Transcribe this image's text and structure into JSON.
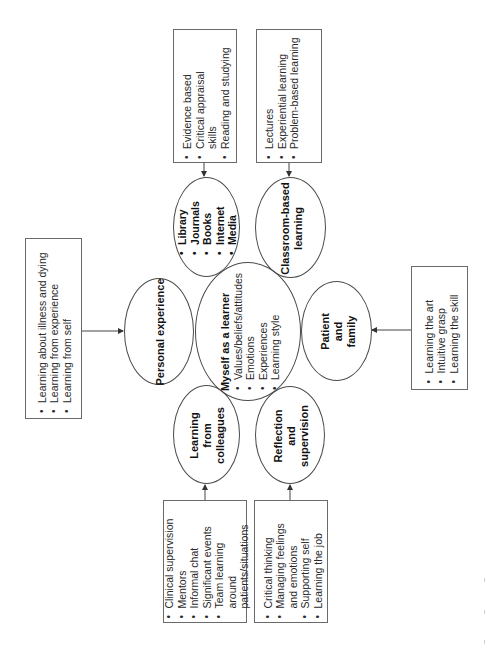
{
  "center": {
    "title": "Myself as a learner",
    "items": [
      "Values/beliefs/attitudes",
      "Emotions",
      "Experiences",
      "Learning style"
    ]
  },
  "nodes": {
    "personal": {
      "title": "Personal experience"
    },
    "library": {
      "items": [
        "Library",
        "Journals",
        "Books",
        "Internet",
        "Media"
      ]
    },
    "classroom": {
      "line1": "Classroom-based",
      "line2": "learning"
    },
    "patient": {
      "line1": "Patient",
      "line2": "and",
      "line3": "family"
    },
    "colleagues": {
      "line1": "Learning",
      "line2": "from",
      "line3": "colleagues"
    },
    "reflection": {
      "line1": "Reflection",
      "line2": "and",
      "line3": "supervision"
    }
  },
  "boxes": {
    "personal": {
      "items": [
        "Learning about illness and dying",
        "Learning from experience",
        "Learning from self"
      ]
    },
    "library": {
      "items": [
        "Evidence based",
        "Critical appraisal skills",
        "Reading and studying"
      ]
    },
    "classroom": {
      "items": [
        "Lectures",
        "Experiential learning",
        "Problem-based learning"
      ]
    },
    "patient": {
      "items": [
        "Learning the art",
        "Intuitive grasp",
        "Learning the skill"
      ]
    },
    "colleagues": {
      "items": [
        "Clinical supervision",
        "Mentors",
        "Informal chat",
        "Significant events",
        "Team learning around patients/situations"
      ]
    },
    "reflection": {
      "items": [
        "Critical thinking",
        "Managing feelings and emotions",
        "Supporting self",
        "Learning the job"
      ]
    }
  },
  "colors": {
    "line": "#4a4a4a",
    "box_border": "#6a6a6a",
    "text": "#1e1e1e",
    "background": "#ffffff"
  }
}
